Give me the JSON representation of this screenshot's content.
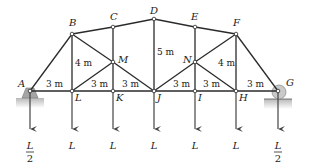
{
  "diagram": {
    "type": "truss",
    "nodes": {
      "A": {
        "label": "A",
        "x": 30,
        "y": 91
      },
      "L": {
        "label": "L",
        "x": 72,
        "y": 91
      },
      "K": {
        "label": "K",
        "x": 113,
        "y": 91
      },
      "J": {
        "label": "J",
        "x": 154,
        "y": 91
      },
      "I": {
        "label": "I",
        "x": 195,
        "y": 91
      },
      "H": {
        "label": "H",
        "x": 236,
        "y": 91
      },
      "G": {
        "label": "G",
        "x": 278,
        "y": 91
      },
      "B": {
        "label": "B",
        "x": 72,
        "y": 34
      },
      "C": {
        "label": "C",
        "x": 113,
        "y": 27
      },
      "D": {
        "label": "D",
        "x": 154,
        "y": 19
      },
      "E": {
        "label": "E",
        "x": 195,
        "y": 27
      },
      "F": {
        "label": "F",
        "x": 236,
        "y": 34
      },
      "M": {
        "label": "M",
        "x": 113,
        "y": 62
      },
      "N": {
        "label": "N",
        "x": 195,
        "y": 62
      }
    },
    "members": [
      [
        "A",
        "L"
      ],
      [
        "L",
        "K"
      ],
      [
        "K",
        "J"
      ],
      [
        "J",
        "I"
      ],
      [
        "I",
        "H"
      ],
      [
        "H",
        "G"
      ],
      [
        "A",
        "B"
      ],
      [
        "B",
        "C"
      ],
      [
        "C",
        "D"
      ],
      [
        "D",
        "E"
      ],
      [
        "E",
        "F"
      ],
      [
        "F",
        "G"
      ],
      [
        "B",
        "L"
      ],
      [
        "C",
        "M"
      ],
      [
        "M",
        "K"
      ],
      [
        "D",
        "J"
      ],
      [
        "E",
        "N"
      ],
      [
        "N",
        "I"
      ],
      [
        "F",
        "H"
      ],
      [
        "B",
        "M"
      ],
      [
        "M",
        "J"
      ],
      [
        "L",
        "M"
      ],
      [
        "J",
        "N"
      ],
      [
        "N",
        "F"
      ],
      [
        "N",
        "H"
      ]
    ],
    "dimensions": [
      {
        "text": "3 m",
        "x": 46,
        "y": 87
      },
      {
        "text": "3 m",
        "x": 91,
        "y": 87
      },
      {
        "text": "3 m",
        "x": 122,
        "y": 87
      },
      {
        "text": "3 m",
        "x": 173,
        "y": 87
      },
      {
        "text": "3 m",
        "x": 203,
        "y": 87
      },
      {
        "text": "3 m",
        "x": 247,
        "y": 87
      },
      {
        "text": "4 m",
        "x": 75,
        "y": 66
      },
      {
        "text": "5 m",
        "x": 157,
        "y": 55
      },
      {
        "text": "4 m",
        "x": 218,
        "y": 66
      }
    ],
    "loads": [
      {
        "node": "A",
        "label_num": "L",
        "label_den": "2"
      },
      {
        "node": "L",
        "label_num": "L"
      },
      {
        "node": "K",
        "label_num": "L"
      },
      {
        "node": "J",
        "label_num": "L"
      },
      {
        "node": "I",
        "label_num": "L"
      },
      {
        "node": "H",
        "label_num": "L"
      },
      {
        "node": "G",
        "label_num": "L",
        "label_den": "2"
      }
    ],
    "supports": {
      "A": "pin",
      "G": "roller"
    },
    "colors": {
      "member": "#2a2a2a",
      "support": "#9a9a9a",
      "ground": "#bdbdbd"
    }
  }
}
